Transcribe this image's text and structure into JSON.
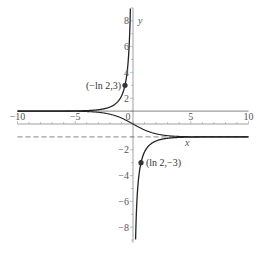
{
  "chart_data": {
    "type": "line",
    "title": "",
    "xlabel": "x",
    "ylabel": "y",
    "xlim": [
      -10,
      10
    ],
    "ylim": [
      -9,
      9
    ],
    "grid": false,
    "legend": null,
    "x_ticks": [
      {
        "value": -10,
        "label": "−10"
      },
      {
        "value": -5,
        "label": "−5"
      },
      {
        "value": 0,
        "label": "0"
      },
      {
        "value": 5,
        "label": "5"
      },
      {
        "value": 10,
        "label": "10"
      }
    ],
    "y_ticks": [
      {
        "value": -8,
        "label": "−8"
      },
      {
        "value": -6,
        "label": "−6"
      },
      {
        "value": -4,
        "label": "−4"
      },
      {
        "value": -2,
        "label": "−2"
      },
      {
        "value": 2,
        "label": "2"
      },
      {
        "value": 4,
        "label": "4"
      },
      {
        "value": 6,
        "label": "6"
      },
      {
        "value": 8,
        "label": "8"
      }
    ],
    "series": [
      {
        "name": "y = (1 + e^x) / (1 - e^x)",
        "style": "solid",
        "branches": [
          {
            "x": [
              -10,
              -6,
              -4,
              -3,
              -2,
              -1.5,
              -1,
              -0.693,
              -0.5,
              -0.3,
              -0.2,
              -0.12
            ],
            "y": [
              1.0001,
              1.005,
              1.037,
              1.105,
              1.313,
              1.572,
              2.164,
              3.0,
              4.083,
              6.716,
              10.03,
              16.67
            ]
          },
          {
            "x": [
              0.12,
              0.2,
              0.3,
              0.5,
              0.693,
              1,
              1.5,
              2,
              3,
              4,
              6,
              10
            ],
            "y": [
              -16.67,
              -10.03,
              -6.716,
              -4.083,
              -3.0,
              -2.164,
              -1.572,
              -1.313,
              -1.105,
              -1.037,
              -1.005,
              -1.0001
            ]
          }
        ]
      },
      {
        "name": "y = (1 - e^x) / (1 + e^x)",
        "style": "solid",
        "x": [
          -10,
          -6,
          -4,
          -3,
          -2,
          -1,
          0,
          1,
          2,
          3,
          4,
          6,
          10
        ],
        "y": [
          0.9999,
          0.995,
          0.964,
          0.905,
          0.762,
          0.462,
          0,
          -0.462,
          -0.762,
          -0.905,
          -0.964,
          -0.995,
          -0.9999
        ]
      },
      {
        "name": "asymptote y = 1",
        "style": "solid-thin",
        "x": [
          -10,
          10
        ],
        "y": [
          1,
          1
        ]
      },
      {
        "name": "asymptote y = -1",
        "style": "dashed",
        "x": [
          -10,
          10
        ],
        "y": [
          -1,
          -1
        ]
      }
    ],
    "points": [
      {
        "x": -0.693,
        "y": 3,
        "label": "(−ln 2,3)"
      },
      {
        "x": 0.693,
        "y": -3,
        "label": "(ln 2,−3)"
      }
    ],
    "annotations": [
      "(−ln 2,3)",
      "(ln 2,−3)"
    ]
  }
}
